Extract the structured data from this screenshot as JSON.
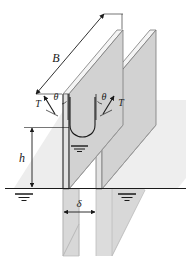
{
  "figure": {
    "name": "capillary-rise-between-parallel-plates",
    "labels": {
      "plate_width": "B",
      "rise_height": "h",
      "gap": "δ",
      "tension_left": "T",
      "tension_right": "T",
      "angle_left": "θ",
      "angle_right": "θ"
    },
    "colors": {
      "plate_face": "#d2d2d2",
      "plate_top": "#f2f2f2",
      "plate_edge": "#6f6f6f",
      "submerged_plate": "#dcdcdc",
      "shadow": "#ededed",
      "line": "#1a1a1a",
      "background": "#ffffff"
    },
    "annotations": {
      "water_surface_symbol_count": 2,
      "meniscus_symbol_count": 1
    }
  }
}
